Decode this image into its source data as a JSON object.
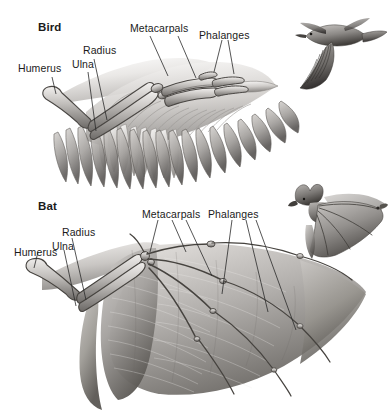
{
  "figure": {
    "background_color": "#ffffff",
    "width": 391,
    "height": 413,
    "style": "grayscale scientific illustration"
  },
  "bird": {
    "heading": "Bird",
    "labels": {
      "humerus": "Humerus",
      "radius": "Radius",
      "ulna": "Ulna",
      "metacarpals": "Metacarpals",
      "phalanges": "Phalanges"
    },
    "inset_caption": "flying-bird-inset"
  },
  "bat": {
    "heading": "Bat",
    "labels": {
      "humerus": "Humerus",
      "radius": "Radius",
      "ulna": "Ulna",
      "metacarpals": "Metacarpals",
      "phalanges": "Phalanges"
    },
    "inset_caption": "flying-bat-inset"
  },
  "colors": {
    "ink": "#1b1b1b",
    "leader_line": "#2a2a2a",
    "bone_light": "#e6e4e2",
    "bone_mid": "#b9b6b3",
    "bone_dark": "#6e6b68",
    "feather_light": "#f0eeec",
    "feather_mid": "#b5b2af",
    "feather_dark": "#6a6765",
    "membrane_light": "#d9d6d3",
    "membrane_mid": "#a8a5a2",
    "membrane_dark": "#57544f"
  }
}
